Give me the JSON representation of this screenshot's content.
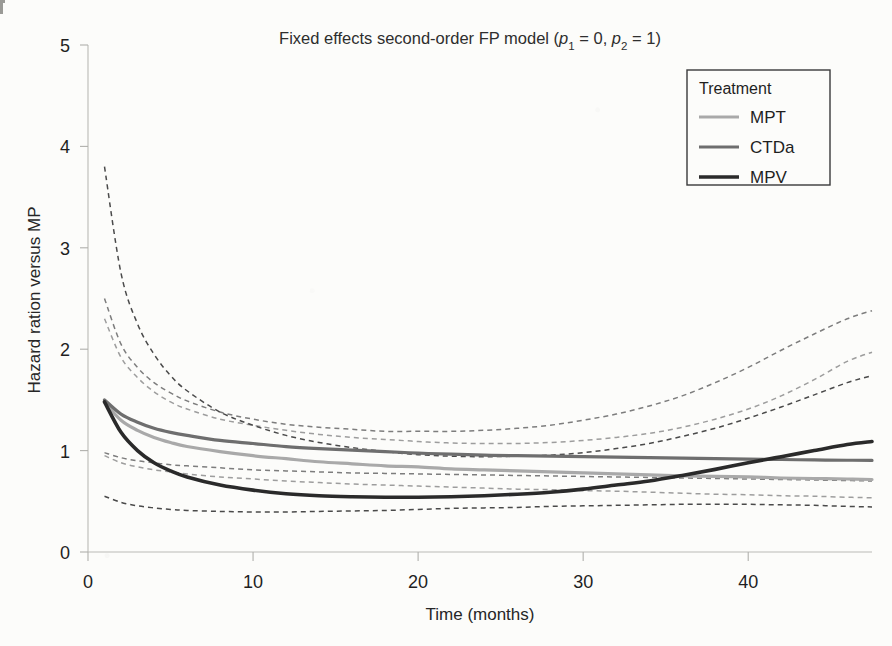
{
  "figure": {
    "background_color": "#fcfcfa",
    "title_parts": {
      "lead": "Fixed effects second-order FP model (",
      "p1_base": "p",
      "p1_sub": "1",
      "eq1": " = 0, ",
      "p2_base": "p",
      "p2_sub": "2",
      "eq2": " = 1)"
    }
  },
  "axes": {
    "x_label": "Time (months)",
    "y_label": "Hazard ration versus MP",
    "x_ticks": [
      "0",
      "10",
      "20",
      "30",
      "40"
    ],
    "x_tick_values": [
      0,
      10,
      20,
      30,
      40
    ],
    "y_ticks": [
      "0",
      "1",
      "2",
      "3",
      "4",
      "5"
    ],
    "y_tick_values": [
      0,
      1,
      2,
      3,
      4,
      5
    ],
    "xlim": [
      0,
      47.5
    ],
    "ylim": [
      0,
      5
    ],
    "grid": false
  },
  "legend": {
    "title": "Treatment",
    "position": "top-right",
    "border_color": "#3a3a3a",
    "entries": [
      {
        "label": "MPT",
        "color": "#a9a9a9",
        "width": 3.2
      },
      {
        "label": "CTDa",
        "color": "#6e6e6e",
        "width": 3.2
      },
      {
        "label": "MPV",
        "color": "#2a2a2a",
        "width": 3.6
      }
    ]
  },
  "chart_data": {
    "type": "line",
    "title": "Fixed effects second-order FP model (p1 = 0, p2 = 1)",
    "xlabel": "Time (months)",
    "ylabel": "Hazard ration versus MP",
    "xlim": [
      0,
      47.5
    ],
    "ylim": [
      0,
      5
    ],
    "xticks": [
      0,
      10,
      20,
      30,
      40
    ],
    "yticks": [
      0,
      1,
      2,
      3,
      4,
      5
    ],
    "grid": false,
    "legend": "top-right",
    "reference_group": "MP",
    "x": [
      1,
      2,
      3,
      4,
      5,
      6,
      8,
      10,
      12,
      14,
      16,
      18,
      20,
      22,
      24,
      26,
      28,
      30,
      32,
      34,
      36,
      38,
      40,
      42,
      44,
      46,
      47.5
    ],
    "series": [
      {
        "name": "MPT",
        "color": "#a9a9a9",
        "style": "solid",
        "values": [
          1.48,
          1.3,
          1.2,
          1.13,
          1.08,
          1.04,
          0.99,
          0.95,
          0.92,
          0.89,
          0.87,
          0.85,
          0.84,
          0.82,
          0.81,
          0.8,
          0.79,
          0.78,
          0.77,
          0.76,
          0.75,
          0.745,
          0.74,
          0.73,
          0.725,
          0.72,
          0.715
        ],
        "ci_lower": [
          0.95,
          0.88,
          0.84,
          0.81,
          0.79,
          0.77,
          0.74,
          0.72,
          0.7,
          0.685,
          0.67,
          0.66,
          0.65,
          0.64,
          0.63,
          0.62,
          0.615,
          0.605,
          0.6,
          0.59,
          0.58,
          0.57,
          0.565,
          0.555,
          0.55,
          0.54,
          0.535
        ],
        "ci_upper": [
          2.3,
          1.92,
          1.72,
          1.58,
          1.48,
          1.41,
          1.31,
          1.25,
          1.2,
          1.16,
          1.13,
          1.11,
          1.09,
          1.075,
          1.07,
          1.07,
          1.08,
          1.1,
          1.13,
          1.17,
          1.23,
          1.31,
          1.41,
          1.54,
          1.7,
          1.88,
          1.97
        ]
      },
      {
        "name": "CTDa",
        "color": "#6e6e6e",
        "style": "solid",
        "values": [
          1.5,
          1.36,
          1.28,
          1.22,
          1.18,
          1.15,
          1.1,
          1.07,
          1.04,
          1.02,
          1.005,
          0.99,
          0.975,
          0.965,
          0.955,
          0.95,
          0.945,
          0.94,
          0.935,
          0.93,
          0.925,
          0.92,
          0.915,
          0.912,
          0.908,
          0.905,
          0.903
        ],
        "ci_lower": [
          0.98,
          0.93,
          0.9,
          0.88,
          0.86,
          0.85,
          0.83,
          0.81,
          0.8,
          0.79,
          0.78,
          0.775,
          0.77,
          0.765,
          0.76,
          0.755,
          0.75,
          0.745,
          0.74,
          0.735,
          0.73,
          0.725,
          0.72,
          0.715,
          0.71,
          0.705,
          0.7
        ],
        "ci_upper": [
          2.5,
          2.05,
          1.82,
          1.67,
          1.57,
          1.49,
          1.38,
          1.31,
          1.26,
          1.23,
          1.21,
          1.19,
          1.19,
          1.19,
          1.2,
          1.22,
          1.25,
          1.3,
          1.36,
          1.44,
          1.54,
          1.67,
          1.82,
          1.99,
          2.15,
          2.3,
          2.38
        ]
      },
      {
        "name": "MPV",
        "color": "#2a2a2a",
        "style": "solid",
        "values": [
          1.48,
          1.18,
          1.0,
          0.88,
          0.8,
          0.74,
          0.66,
          0.61,
          0.575,
          0.555,
          0.545,
          0.54,
          0.54,
          0.545,
          0.555,
          0.57,
          0.59,
          0.62,
          0.66,
          0.7,
          0.755,
          0.815,
          0.88,
          0.94,
          1.0,
          1.06,
          1.09
        ],
        "ci_lower": [
          0.55,
          0.49,
          0.455,
          0.435,
          0.42,
          0.41,
          0.4,
          0.395,
          0.395,
          0.4,
          0.405,
          0.41,
          0.42,
          0.43,
          0.435,
          0.44,
          0.45,
          0.455,
          0.46,
          0.465,
          0.47,
          0.47,
          0.47,
          0.465,
          0.46,
          0.45,
          0.445
        ],
        "ci_upper": [
          3.8,
          2.75,
          2.25,
          1.95,
          1.74,
          1.59,
          1.38,
          1.25,
          1.15,
          1.08,
          1.03,
          0.99,
          0.96,
          0.945,
          0.94,
          0.945,
          0.955,
          0.98,
          1.02,
          1.07,
          1.14,
          1.22,
          1.32,
          1.43,
          1.55,
          1.67,
          1.74
        ]
      }
    ],
    "ci_style": "dashed",
    "ci_description": "Dashed lines show 95% confidence limits for each treatment curve."
  }
}
